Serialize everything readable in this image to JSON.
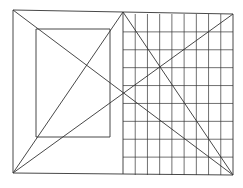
{
  "diagram": {
    "background": "#ffffff",
    "stroke": "#333333",
    "outer_frame": {
      "left": 13,
      "top": 10,
      "split_x": 123,
      "right": 233,
      "bottom_left": 173,
      "bottom_right": 175,
      "top_right": 14
    },
    "inner_rect": {
      "x1": 36,
      "y1": 29,
      "x2": 110,
      "y2": 137
    },
    "grid": {
      "x_start": 123,
      "x_end": 233,
      "y_start": 14,
      "y_end": 175,
      "columns": 9,
      "rows": 9
    },
    "diagonals": [
      {
        "name": "outer-top-left-to-bottom-right",
        "x1": 13,
        "y1": 10,
        "x2": 233,
        "y2": 175
      },
      {
        "name": "bottom-left-to-top-right",
        "x1": 13,
        "y1": 173,
        "x2": 233,
        "y2": 14
      },
      {
        "name": "bottom-left-to-apex",
        "x1": 13,
        "y1": 173,
        "x2": 123,
        "y2": 12
      },
      {
        "name": "apex-to-bottom-right",
        "x1": 123,
        "y1": 12,
        "x2": 233,
        "y2": 175
      }
    ]
  }
}
